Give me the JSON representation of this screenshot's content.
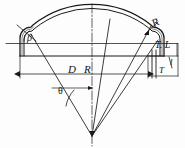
{
  "figure": {
    "type": "engineering-drawing",
    "stroke_color": "#1a1a1a",
    "background_color": "#fdfdfd"
  },
  "labels": {
    "knuckle_angle": "β",
    "knuckle_radius": "R",
    "tangent_line": "T. L",
    "diameter": "D",
    "crown_radius": "R",
    "thickness": "T",
    "straight_flange": "l",
    "half_apex_angle": "θ"
  },
  "geometry": {
    "centerline_x": 92,
    "apex_x": 92,
    "apex_y": 136,
    "tangent_line_y": 44,
    "base_line_y": 56,
    "left_edge_x": 20,
    "right_edge_x": 148,
    "crown_top_y": 13,
    "wall_offset": 3.5,
    "dimension_line_y": 74
  },
  "annotations": [
    {
      "name": "knuckle-angle-beta",
      "text": "β",
      "x": 27,
      "y": 33
    },
    {
      "name": "knuckle-radius-r",
      "text": "R",
      "x": 152,
      "y": 17
    },
    {
      "name": "tangent-line-tl",
      "text": "T. L",
      "x": 155,
      "y": 40
    },
    {
      "name": "diameter-d",
      "text": "D",
      "x": 68,
      "y": 64
    },
    {
      "name": "crown-radius-r",
      "text": "R",
      "x": 84,
      "y": 64
    },
    {
      "name": "thickness-t",
      "text": "T",
      "x": 159,
      "y": 66
    },
    {
      "name": "straight-flange-l",
      "text": "l",
      "x": 170,
      "y": 58
    },
    {
      "name": "half-apex-angle-theta",
      "text": "θ",
      "x": 58,
      "y": 86
    }
  ]
}
